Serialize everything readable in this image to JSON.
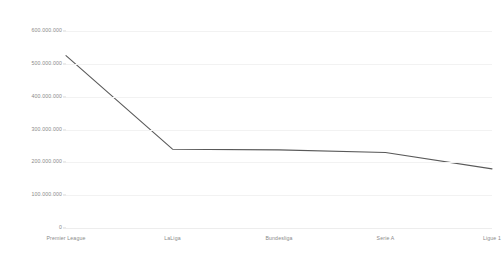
{
  "chart_data": {
    "type": "line",
    "title": "",
    "xlabel": "",
    "ylabel": "",
    "categories": [
      "Premier League",
      "LaLiga",
      "Bundesliga",
      "Serie A",
      "Ligue 1"
    ],
    "series": [
      {
        "name": "Revenue",
        "values": [
          525000000,
          240000000,
          238000000,
          230000000,
          180000000
        ],
        "color": "#595959"
      }
    ],
    "ylim": [
      0,
      600000000
    ],
    "y_ticks": [
      0,
      100000000,
      200000000,
      300000000,
      400000000,
      500000000,
      600000000
    ],
    "y_tick_labels": [
      "0",
      "100.000.000",
      "200.000.000",
      "300.000.000",
      "400.000.000",
      "500.000.000",
      "600.000.000"
    ],
    "grid": true,
    "legend": "none",
    "grid_color": "#f2f2f2",
    "axis_text_color": "#8a8a8a"
  }
}
